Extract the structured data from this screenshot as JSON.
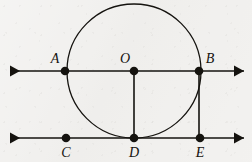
{
  "figure": {
    "kind": "euclidean-geometry-diagram",
    "width": 252,
    "height": 162,
    "background_color": "#f1f0ee",
    "ink_color": "#15130f",
    "stroke_width": 1.6,
    "circle_stroke_width": 1.3
  },
  "circle": {
    "name": "main-circle",
    "center_label": "O",
    "cx": 134,
    "cy": 71,
    "r": 67,
    "tangent_point_label": "D"
  },
  "lines": [
    {
      "name": "upper-line",
      "y": 71,
      "x_start": 10,
      "x_end": 244,
      "arrow_start": true,
      "arrow_end": true,
      "through_labels": [
        "A",
        "O",
        "B"
      ]
    },
    {
      "name": "lower-line",
      "y": 138,
      "x_start": 10,
      "x_end": 244,
      "arrow_start": true,
      "arrow_end": true,
      "through_labels": [
        "C",
        "D",
        "E"
      ]
    }
  ],
  "segments": [
    {
      "name": "segment-OD",
      "from": "O",
      "to": "D",
      "x1": 134,
      "y1": 71,
      "x2": 134,
      "y2": 138
    },
    {
      "name": "segment-BE",
      "from": "B",
      "to": "E",
      "x1": 199,
      "y1": 71,
      "x2": 199,
      "y2": 138
    }
  ],
  "points": [
    {
      "label": "A",
      "x": 65,
      "y": 71,
      "dot_r": 4.3,
      "label_x": 55,
      "label_y": 63,
      "anchor": "middle"
    },
    {
      "label": "O",
      "x": 134,
      "y": 71,
      "dot_r": 4.3,
      "label_x": 125,
      "label_y": 63,
      "anchor": "middle"
    },
    {
      "label": "B",
      "x": 199,
      "y": 71,
      "dot_r": 4.3,
      "label_x": 210,
      "label_y": 63,
      "anchor": "middle"
    },
    {
      "label": "C",
      "x": 66,
      "y": 138,
      "dot_r": 4.3,
      "label_x": 66,
      "label_y": 157,
      "anchor": "middle"
    },
    {
      "label": "D",
      "x": 134,
      "y": 138,
      "dot_r": 4.3,
      "label_x": 134,
      "label_y": 157,
      "anchor": "middle"
    },
    {
      "label": "E",
      "x": 200,
      "y": 138,
      "dot_r": 4.3,
      "label_x": 200,
      "label_y": 157,
      "anchor": "middle"
    }
  ]
}
